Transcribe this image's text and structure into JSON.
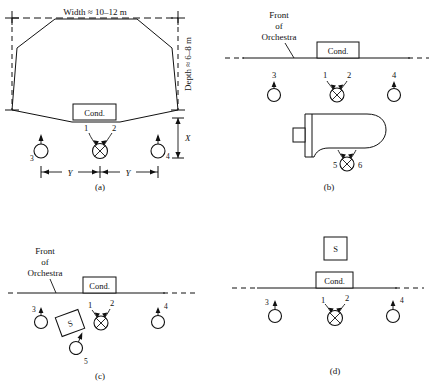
{
  "figure": {
    "line_color": "#111111",
    "background": "#ffffff"
  },
  "labels": {
    "width_dim": "Width ≈ 10–12 m",
    "depth_dim": "Depth ≈ 6–8 m",
    "x_dim": "X",
    "y_dim_left": "Y",
    "y_dim_right": "Y",
    "conductor": "Cond.",
    "soloist": "S",
    "front_line1": "Front",
    "front_line2": "of",
    "front_line3": "Orchestra"
  },
  "mic_numbers": {
    "one": "1",
    "two": "2",
    "three": "3",
    "four": "4",
    "five": "5",
    "six": "6",
    "five_c": "5"
  },
  "panels": [
    {
      "id": "a",
      "caption": "(a)",
      "description": "Plan view of octagonal stage with width and depth dimensions, conductor podium, stereo pair 1-2 and outrigger mics 3 and 4",
      "mics": [
        "1",
        "2",
        "3",
        "4"
      ],
      "has_stage_outline": true,
      "has_piano": false,
      "has_soloist": false
    },
    {
      "id": "b",
      "caption": "(b)",
      "description": "Stage edge with conductor, mics 1-2, 3, 4 and grand piano with mics 5-6",
      "mics": [
        "1",
        "2",
        "3",
        "4",
        "5",
        "6"
      ],
      "has_stage_outline": false,
      "has_piano": true,
      "has_soloist": false
    },
    {
      "id": "c",
      "caption": "(c)",
      "description": "Stage edge with conductor, mics 1-2, 3, 4 and tilted soloist box with mic 5",
      "mics": [
        "1",
        "2",
        "3",
        "4",
        "5"
      ],
      "has_stage_outline": false,
      "has_piano": false,
      "has_soloist": true
    },
    {
      "id": "d",
      "caption": "(d)",
      "description": "Stage edge with soloist box behind conductor, mics 1-2, 3 and 4",
      "mics": [
        "1",
        "2",
        "3",
        "4"
      ],
      "has_stage_outline": false,
      "has_piano": false,
      "has_soloist": true
    }
  ]
}
